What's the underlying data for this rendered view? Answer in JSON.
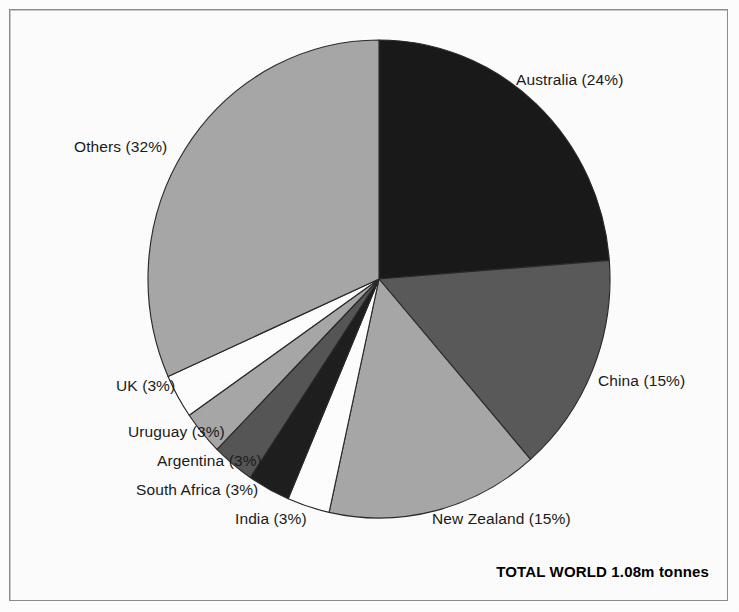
{
  "figure": {
    "background_color": "#ffffff",
    "frame_color": "#8d8d8d",
    "total_caption": "TOTAL WORLD 1.08m tonnes"
  },
  "chart_data": {
    "type": "pie",
    "title": "",
    "subtitle": "",
    "xlabel": "",
    "ylabel": "",
    "legend_position": "none",
    "grid": false,
    "units": "percent of world wool production",
    "total_value": "1.08m tonnes",
    "start_angle_deg": 0,
    "direction": "clockwise",
    "categories": [
      "Australia",
      "China",
      "New Zealand",
      "India",
      "South Africa",
      "Argentina",
      "Uruguay",
      "UK",
      "Others"
    ],
    "values": [
      24,
      15,
      15,
      3,
      3,
      3,
      3,
      3,
      32
    ],
    "colors": [
      "#1a1a1a",
      "#5a5a5a",
      "#a8a8a8",
      "#ffffff",
      "#1f1f1f",
      "#565656",
      "#a8a8a8",
      "#ffffff",
      "#a8a8a8"
    ],
    "slices": [
      {
        "label": "Australia (24%)",
        "name": "Australia",
        "value": 24,
        "color": "#1a1a1a",
        "label_x": 516,
        "label_y": 72
      },
      {
        "label": "China (15%)",
        "name": "China",
        "value": 15,
        "color": "#5a5a5a",
        "label_x": 598,
        "label_y": 373
      },
      {
        "label": "New Zealand (15%)",
        "name": "New Zealand",
        "value": 15,
        "color": "#a8a8a8",
        "label_x": 432,
        "label_y": 511
      },
      {
        "label": "India (3%)",
        "name": "India",
        "value": 3,
        "color": "#ffffff",
        "label_x": 235,
        "label_y": 511
      },
      {
        "label": "South Africa (3%)",
        "name": "South Africa",
        "value": 3,
        "color": "#1f1f1f",
        "label_x": 136,
        "label_y": 482
      },
      {
        "label": "Argentina (3%)",
        "name": "Argentina",
        "value": 3,
        "color": "#565656",
        "label_x": 157,
        "label_y": 453
      },
      {
        "label": "Uruguay (3%)",
        "name": "Uruguay",
        "value": 3,
        "color": "#a8a8a8",
        "label_x": 128,
        "label_y": 424
      },
      {
        "label": "UK (3%)",
        "name": "UK",
        "value": 3,
        "color": "#ffffff",
        "label_x": 116,
        "label_y": 378
      },
      {
        "label": "Others (32%)",
        "name": "Others",
        "value": 32,
        "color": "#a8a8a8",
        "label_x": 74,
        "label_y": 139
      }
    ],
    "geometry": {
      "center_x": 379,
      "center_y": 279,
      "radius_x": 231,
      "radius_y": 239
    }
  }
}
